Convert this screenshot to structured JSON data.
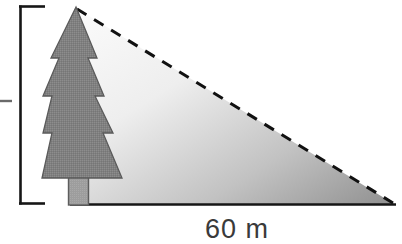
{
  "figure": {
    "type": "geometry-diagram",
    "background_color": "#ffffff"
  },
  "labels": {
    "base_label": "60 m",
    "height_label": ""
  },
  "tree": {
    "name": "pine-tree",
    "foliage_color": "#808080",
    "foliage_outline_color": "#555555",
    "trunk_color": "#9a9a9a",
    "trunk_outline_color": "#5a5a5a",
    "tiers": 4
  },
  "triangle": {
    "name": "right-triangle",
    "gradient_light": "#f7f7f7",
    "gradient_dark": "#949494",
    "baseline_color": "#1a1a1a",
    "hypotenuse_style": "dashed",
    "hypotenuse_color": "#111111",
    "apex": {
      "x": 76,
      "y": 8
    },
    "right_vertex": {
      "x": 394,
      "y": 204
    },
    "left_vertex": {
      "x": 88,
      "y": 204
    }
  },
  "measure_bracket": {
    "name": "height-bracket",
    "color": "#1a1a1a",
    "top_y": 6,
    "bottom_y": 204,
    "spine_x": 20,
    "arm_end_x": 45,
    "tick_y": 101,
    "tick_x_start": 0,
    "tick_x_end": 12
  },
  "colors": {
    "ink": "#1a1a1a",
    "text": "#3a3a3a",
    "foliage": "#808080",
    "trunk": "#9a9a9a"
  }
}
